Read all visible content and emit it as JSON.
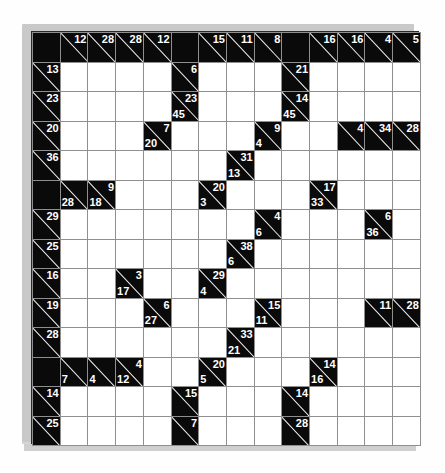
{
  "puzzle": {
    "name": "kakuro-grid",
    "rows": 14,
    "cols": 14,
    "colors": {
      "block": "#0a0a0a",
      "open": "#ffffff",
      "gridline": "#8f8f8f",
      "clue_text": "#ffffff"
    },
    "cells": [
      [
        {
          "t": "block"
        },
        {
          "t": "clue",
          "down": "12"
        },
        {
          "t": "clue",
          "down": "28"
        },
        {
          "t": "clue",
          "down": "28"
        },
        {
          "t": "clue",
          "down": "12"
        },
        {
          "t": "block"
        },
        {
          "t": "clue",
          "down": "15"
        },
        {
          "t": "clue",
          "down": "11"
        },
        {
          "t": "clue",
          "down": "8"
        },
        {
          "t": "block"
        },
        {
          "t": "clue",
          "down": "16"
        },
        {
          "t": "clue",
          "down": "16"
        },
        {
          "t": "clue",
          "down": "4"
        },
        {
          "t": "clue",
          "down": "5"
        }
      ],
      [
        {
          "t": "clue",
          "down": "13"
        },
        {
          "t": "open"
        },
        {
          "t": "open"
        },
        {
          "t": "open"
        },
        {
          "t": "open"
        },
        {
          "t": "clue",
          "down": "6"
        },
        {
          "t": "open"
        },
        {
          "t": "open"
        },
        {
          "t": "open"
        },
        {
          "t": "clue",
          "down": "21"
        },
        {
          "t": "open"
        },
        {
          "t": "open"
        },
        {
          "t": "open"
        },
        {
          "t": "open"
        }
      ],
      [
        {
          "t": "clue",
          "down": "23"
        },
        {
          "t": "open"
        },
        {
          "t": "open"
        },
        {
          "t": "open"
        },
        {
          "t": "open"
        },
        {
          "t": "clue",
          "down": "23",
          "across": "45"
        },
        {
          "t": "open"
        },
        {
          "t": "open"
        },
        {
          "t": "open"
        },
        {
          "t": "clue",
          "down": "14",
          "across": "45"
        },
        {
          "t": "open"
        },
        {
          "t": "open"
        },
        {
          "t": "open"
        },
        {
          "t": "open"
        }
      ],
      [
        {
          "t": "clue",
          "down": "20"
        },
        {
          "t": "open"
        },
        {
          "t": "open"
        },
        {
          "t": "open"
        },
        {
          "t": "clue",
          "down": "7",
          "across": "20"
        },
        {
          "t": "open"
        },
        {
          "t": "open"
        },
        {
          "t": "open"
        },
        {
          "t": "clue",
          "down": "9",
          "across": "4"
        },
        {
          "t": "open"
        },
        {
          "t": "open"
        },
        {
          "t": "clue",
          "down": "4"
        },
        {
          "t": "clue",
          "down": "34"
        },
        {
          "t": "clue",
          "down": "28"
        }
      ],
      [
        {
          "t": "clue",
          "down": "36"
        },
        {
          "t": "open"
        },
        {
          "t": "open"
        },
        {
          "t": "open"
        },
        {
          "t": "open"
        },
        {
          "t": "open"
        },
        {
          "t": "open"
        },
        {
          "t": "clue",
          "down": "31",
          "across": "13"
        },
        {
          "t": "open"
        },
        {
          "t": "open"
        },
        {
          "t": "open"
        },
        {
          "t": "open"
        },
        {
          "t": "open"
        },
        {
          "t": "open"
        }
      ],
      [
        {
          "t": "block"
        },
        {
          "t": "clue",
          "across": "28"
        },
        {
          "t": "clue",
          "down": "9",
          "across": "18"
        },
        {
          "t": "open"
        },
        {
          "t": "open"
        },
        {
          "t": "open"
        },
        {
          "t": "clue",
          "down": "20",
          "across": "3"
        },
        {
          "t": "open"
        },
        {
          "t": "open"
        },
        {
          "t": "open"
        },
        {
          "t": "clue",
          "down": "17",
          "across": "33"
        },
        {
          "t": "open"
        },
        {
          "t": "open"
        },
        {
          "t": "open"
        }
      ],
      [
        {
          "t": "clue",
          "down": "29"
        },
        {
          "t": "open"
        },
        {
          "t": "open"
        },
        {
          "t": "open"
        },
        {
          "t": "open"
        },
        {
          "t": "open"
        },
        {
          "t": "open"
        },
        {
          "t": "open"
        },
        {
          "t": "clue",
          "down": "4",
          "across": "6"
        },
        {
          "t": "open"
        },
        {
          "t": "open"
        },
        {
          "t": "open"
        },
        {
          "t": "clue",
          "down": "6",
          "across": "36"
        },
        {
          "t": "open"
        }
      ],
      [
        {
          "t": "clue",
          "down": "25"
        },
        {
          "t": "open"
        },
        {
          "t": "open"
        },
        {
          "t": "open"
        },
        {
          "t": "open"
        },
        {
          "t": "open"
        },
        {
          "t": "open"
        },
        {
          "t": "clue",
          "down": "38",
          "across": "6"
        },
        {
          "t": "open"
        },
        {
          "t": "open"
        },
        {
          "t": "open"
        },
        {
          "t": "open"
        },
        {
          "t": "open"
        },
        {
          "t": "open"
        }
      ],
      [
        {
          "t": "clue",
          "down": "16"
        },
        {
          "t": "open"
        },
        {
          "t": "open"
        },
        {
          "t": "clue",
          "down": "3",
          "across": "17"
        },
        {
          "t": "open"
        },
        {
          "t": "open"
        },
        {
          "t": "clue",
          "down": "29",
          "across": "4"
        },
        {
          "t": "open"
        },
        {
          "t": "open"
        },
        {
          "t": "open"
        },
        {
          "t": "open"
        },
        {
          "t": "open"
        },
        {
          "t": "open"
        },
        {
          "t": "open"
        }
      ],
      [
        {
          "t": "clue",
          "down": "19"
        },
        {
          "t": "open"
        },
        {
          "t": "open"
        },
        {
          "t": "open"
        },
        {
          "t": "clue",
          "down": "6",
          "across": "27"
        },
        {
          "t": "open"
        },
        {
          "t": "open"
        },
        {
          "t": "open"
        },
        {
          "t": "clue",
          "down": "15",
          "across": "11"
        },
        {
          "t": "open"
        },
        {
          "t": "open"
        },
        {
          "t": "open"
        },
        {
          "t": "clue",
          "down": "11"
        },
        {
          "t": "clue",
          "down": "28"
        }
      ],
      [
        {
          "t": "clue",
          "down": "28"
        },
        {
          "t": "open"
        },
        {
          "t": "open"
        },
        {
          "t": "open"
        },
        {
          "t": "open"
        },
        {
          "t": "open"
        },
        {
          "t": "open"
        },
        {
          "t": "clue",
          "down": "33",
          "across": "21"
        },
        {
          "t": "open"
        },
        {
          "t": "open"
        },
        {
          "t": "open"
        },
        {
          "t": "open"
        },
        {
          "t": "open"
        },
        {
          "t": "open"
        }
      ],
      [
        {
          "t": "block"
        },
        {
          "t": "clue",
          "across": "7"
        },
        {
          "t": "clue",
          "across": "4"
        },
        {
          "t": "clue",
          "down": "4",
          "across": "12"
        },
        {
          "t": "open"
        },
        {
          "t": "open"
        },
        {
          "t": "clue",
          "down": "20",
          "across": "5"
        },
        {
          "t": "open"
        },
        {
          "t": "open"
        },
        {
          "t": "open"
        },
        {
          "t": "clue",
          "down": "14",
          "across": "16"
        },
        {
          "t": "open"
        },
        {
          "t": "open"
        },
        {
          "t": "open"
        }
      ],
      [
        {
          "t": "clue",
          "down": "14"
        },
        {
          "t": "open"
        },
        {
          "t": "open"
        },
        {
          "t": "open"
        },
        {
          "t": "open"
        },
        {
          "t": "clue",
          "down": "15"
        },
        {
          "t": "open"
        },
        {
          "t": "open"
        },
        {
          "t": "open"
        },
        {
          "t": "clue",
          "down": "14"
        },
        {
          "t": "open"
        },
        {
          "t": "open"
        },
        {
          "t": "open"
        },
        {
          "t": "open"
        }
      ],
      [
        {
          "t": "clue",
          "down": "25"
        },
        {
          "t": "open"
        },
        {
          "t": "open"
        },
        {
          "t": "open"
        },
        {
          "t": "open"
        },
        {
          "t": "clue",
          "down": "7"
        },
        {
          "t": "open"
        },
        {
          "t": "open"
        },
        {
          "t": "open"
        },
        {
          "t": "clue",
          "down": "28"
        },
        {
          "t": "open"
        },
        {
          "t": "open"
        },
        {
          "t": "open"
        },
        {
          "t": "open"
        }
      ]
    ]
  }
}
